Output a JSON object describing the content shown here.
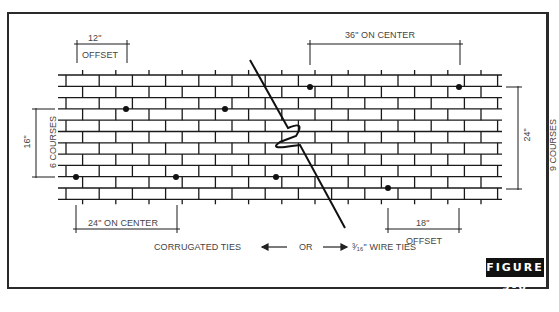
{
  "figure": {
    "tag": "FIGURE 9-6",
    "colors": {
      "ink": "#1a1a1a",
      "label": "#444444",
      "tag_bg": "#111111",
      "tag_text": "#ffffff",
      "paper": "#ffffff"
    }
  },
  "dimensions": {
    "top_left": {
      "value": "12\"",
      "note": "OFFSET"
    },
    "top_right": {
      "value": "36\" ON CENTER"
    },
    "bottom_left": {
      "value": "24\" ON CENTER"
    },
    "bottom_right": {
      "value": "18\"",
      "note": "OFFSET"
    },
    "left_side": {
      "value": "16\"",
      "note": "6 COURSES"
    },
    "right_side": {
      "value": "24\"",
      "note": "9 COURSES"
    }
  },
  "legend": {
    "left_text": "CORRUGATED TIES",
    "middle_text": "OR",
    "right_text": "³⁄₁₆\" WIRE TIES",
    "left_arrow": "arrow-left-icon",
    "right_arrow": "arrow-right-icon"
  },
  "wall": {
    "courses": 11,
    "ties_left_section": [
      {
        "x": 126,
        "y": 109
      },
      {
        "x": 225,
        "y": 109
      },
      {
        "x": 76,
        "y": 177
      },
      {
        "x": 176,
        "y": 177
      },
      {
        "x": 276,
        "y": 177
      }
    ],
    "ties_right_section": [
      {
        "x": 310,
        "y": 87
      },
      {
        "x": 459,
        "y": 87
      },
      {
        "x": 388,
        "y": 188
      }
    ]
  }
}
